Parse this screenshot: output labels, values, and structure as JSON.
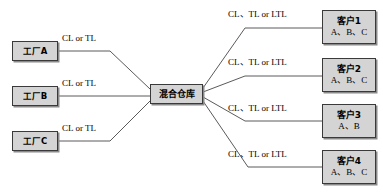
{
  "diagram": {
    "type": "hub-and-spoke supply chain network",
    "colors": {
      "node_fill": "#d4d4d4",
      "node_border": "#3a3a3a",
      "node_shadow": "#8a8a8a",
      "edge_line": "#5a5a5a",
      "background": "#ffffff",
      "text": "#000000"
    },
    "factories": [
      {
        "id": "factory-a",
        "label": "工厂A",
        "x": 12,
        "y": 41,
        "w": 46,
        "h": 20
      },
      {
        "id": "factory-b",
        "label": "工厂B",
        "x": 12,
        "y": 86,
        "w": 46,
        "h": 20
      },
      {
        "id": "factory-c",
        "label": "工厂C",
        "x": 12,
        "y": 131,
        "w": 46,
        "h": 20
      }
    ],
    "hub": {
      "id": "mixed-warehouse",
      "label": "混合仓库",
      "x": 150,
      "y": 84,
      "w": 53,
      "h": 20
    },
    "customers": [
      {
        "id": "customer-1",
        "label": "客户1",
        "products": "A、B、C",
        "x": 322,
        "y": 10,
        "w": 54,
        "h": 34
      },
      {
        "id": "customer-2",
        "label": "客户2",
        "products": "A、B、C",
        "x": 322,
        "y": 58,
        "w": 54,
        "h": 34
      },
      {
        "id": "customer-3",
        "label": "客户3",
        "products": "A、B",
        "x": 322,
        "y": 104,
        "w": 54,
        "h": 34
      },
      {
        "id": "customer-4",
        "label": "客户4",
        "products": "A、B、C",
        "x": 322,
        "y": 150,
        "w": 54,
        "h": 34
      }
    ],
    "inbound_edges": [
      {
        "id": "edge-factory-a",
        "label": "CL or TL",
        "label_x": 62,
        "label_y": 33,
        "path": "M 59,51 L 110,51 L 150,89"
      },
      {
        "id": "edge-factory-b",
        "label": "CL or TL",
        "label_x": 62,
        "label_y": 78,
        "path": "M 59,96 L 150,96"
      },
      {
        "id": "edge-factory-c",
        "label": "CL or TL",
        "label_x": 62,
        "label_y": 123,
        "path": "M 59,141 L 110,141 L 150,101"
      }
    ],
    "outbound_edges": [
      {
        "id": "edge-customer-1",
        "label": "CL、TL or LTL",
        "label_x": 228,
        "label_y": 9,
        "path": "M 203,88 L 245,28 L 322,28"
      },
      {
        "id": "edge-customer-2",
        "label": "CL、TL or LTL",
        "label_x": 228,
        "label_y": 57,
        "path": "M 203,92 L 245,76 L 322,76"
      },
      {
        "id": "edge-customer-3",
        "label": "CL、TL or LTL",
        "label_x": 228,
        "label_y": 103,
        "path": "M 203,97 L 245,121 L 322,121"
      },
      {
        "id": "edge-customer-4",
        "label": "CL、TL or LTL",
        "label_x": 228,
        "label_y": 149,
        "path": "M 203,101 L 248,167 L 322,167"
      }
    ]
  }
}
